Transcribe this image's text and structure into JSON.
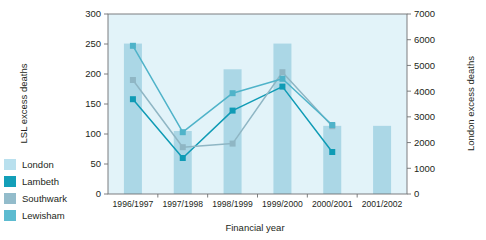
{
  "chart_data": {
    "type": "bar",
    "title": "",
    "xlabel": "Financial year",
    "ylabel": "LSL excess deaths",
    "ylabel_right": "London excess deaths",
    "categories": [
      "1996/1997",
      "1997/1998",
      "1998/1999",
      "1999/2000",
      "2000/2001",
      "2001/2002"
    ],
    "ylim": [
      0,
      300
    ],
    "yticks": [
      0,
      50,
      100,
      150,
      200,
      250,
      300
    ],
    "ylim_right": [
      0,
      7000
    ],
    "yticks_right": [
      0,
      1000,
      2000,
      3000,
      4000,
      5000,
      6000,
      7000
    ],
    "grid": false,
    "legend_position": "left-outside",
    "series": [
      {
        "name": "London",
        "type": "bar",
        "axis": "right",
        "color": "#a8d5e5",
        "values": [
          5850,
          2450,
          4850,
          5850,
          2650,
          2650
        ]
      },
      {
        "name": "Lambeth",
        "type": "line",
        "axis": "left",
        "color": "#0f9bb5",
        "values": [
          158,
          60,
          139,
          179,
          70,
          null
        ]
      },
      {
        "name": "Southwark",
        "type": "line",
        "axis": "left",
        "color": "#8fb6c4",
        "values": [
          190,
          78,
          84,
          203,
          113,
          null
        ]
      },
      {
        "name": "Lewisham",
        "type": "line",
        "axis": "left",
        "color": "#4fb3c9",
        "values": [
          247,
          103,
          168,
          192,
          115,
          null
        ]
      }
    ]
  },
  "legend": {
    "items": [
      {
        "label": "London",
        "color": "#b9e0ee"
      },
      {
        "label": "Lambeth",
        "color": "#139fb8"
      },
      {
        "label": "Southwark",
        "color": "#93bccb"
      },
      {
        "label": "Lewisham",
        "color": "#5cbbd0"
      }
    ]
  },
  "colors": {
    "plot_background": "#e2f3f9",
    "bar": "#a8d5e5",
    "axis": "#6f7072",
    "text": "#231f20"
  }
}
